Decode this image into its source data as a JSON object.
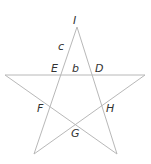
{
  "diagram": {
    "type": "pentagram",
    "colors": {
      "line": "#b8b8b8",
      "text": "#333333",
      "background": "#ffffff"
    },
    "labels": {
      "I": "I",
      "c": "c",
      "E": "E",
      "b": "b",
      "D": "D",
      "F": "F",
      "H": "H",
      "G": "G"
    },
    "points": {
      "I": [
        77,
        27
      ],
      "L": [
        5,
        75
      ],
      "R": [
        145,
        75
      ],
      "BL": [
        34,
        154
      ],
      "BR": [
        117,
        154
      ]
    }
  }
}
